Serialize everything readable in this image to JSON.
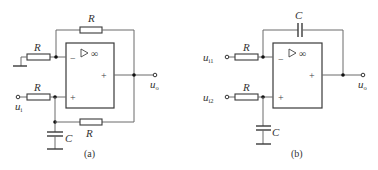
{
  "figures": [
    {
      "id": "a",
      "caption": "(a)",
      "opamp": {
        "symbol": "▷ ∞",
        "inverting": "−",
        "noninverting": "+",
        "output_sign": "+"
      },
      "labels": {
        "feedback_resistor": "R",
        "ground_resistor": "R",
        "input_resistor": "R",
        "positive_feedback_resistor": "R",
        "capacitor": "C",
        "input": "u",
        "input_sub": "i",
        "output": "u",
        "output_sub": "o"
      }
    },
    {
      "id": "b",
      "caption": "(b)",
      "opamp": {
        "symbol": "▷ ∞",
        "inverting": "−",
        "noninverting": "+",
        "output_sign": "+"
      },
      "labels": {
        "feedback_capacitor": "C",
        "input1_resistor": "R",
        "input2_resistor": "R",
        "capacitor": "C",
        "input1": "u",
        "input1_sub": "i1",
        "input2": "u",
        "input2_sub": "i2",
        "output": "u",
        "output_sub": "o"
      }
    }
  ]
}
